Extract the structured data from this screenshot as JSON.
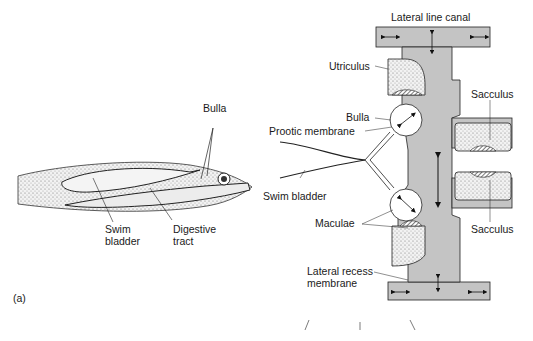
{
  "figure": {
    "panel_label": "(a)",
    "fish": {
      "labels": {
        "bulla": "Bulla",
        "swim_bladder_1": "Swim",
        "swim_bladder_2": "bladder",
        "digestive_1": "Digestive",
        "digestive_2": "tract"
      }
    },
    "ear": {
      "labels": {
        "lateral_line_canal": "Lateral line canal",
        "utriculus": "Utriculus",
        "bulla": "Bulla",
        "prootic_membrane": "Prootic membrane",
        "swim_bladder": "Swim bladder",
        "maculae": "Maculae",
        "sacculus_top": "Sacculus",
        "sacculus_bottom": "Sacculus",
        "lateral_recess_1": "Lateral recess",
        "lateral_recess_2": "membrane"
      }
    },
    "colors": {
      "canal_fill": "#c4c4c4",
      "stipple": "#e6e6e6",
      "ink": "#1a1a1a"
    }
  }
}
